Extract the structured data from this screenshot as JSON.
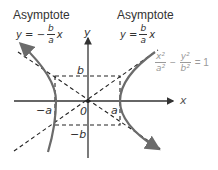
{
  "left_asymptote": {
    "title": "Asymptote",
    "lhs": "y = −",
    "num": "b",
    "den": "a",
    "rhs": "x"
  },
  "right_asymptote": {
    "title": "Asymptote",
    "lhs": "y =",
    "num": "b",
    "den": "a",
    "rhs": "x"
  },
  "hyperbola_equation": {
    "num1": "x²",
    "den1": "a²",
    "minus": "−",
    "num2": "y²",
    "den2": "b²",
    "rhs": "= 1"
  },
  "axes": {
    "x_label": "x",
    "y_label": "y",
    "origin_label": "0"
  },
  "vertex_labels": {
    "neg_a": "−a",
    "pos_a": "a",
    "pos_b": "b",
    "neg_b": "−b"
  },
  "colors": {
    "axis": "#333333",
    "curve": "#6b6b6b",
    "dashed": "#222222",
    "equation_grey": "#9a9a9a"
  }
}
